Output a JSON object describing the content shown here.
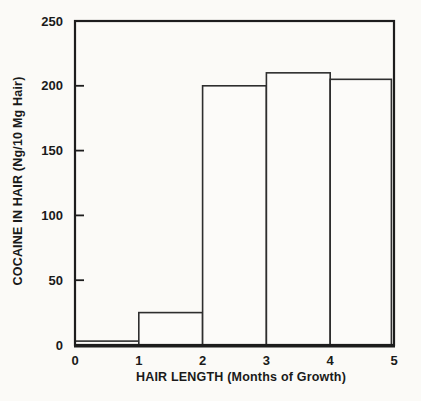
{
  "figure": {
    "background": "#fbfaf7",
    "line_color": "#1d1d1d",
    "bar_fill": "#fcfbf9"
  },
  "chart_data": {
    "type": "bar",
    "title": "",
    "xlabel": "HAIR LENGTH (Months of Growth)",
    "ylabel": "COCAINE IN HAIR (Ng/10 Mg Hair)",
    "categories": [
      "0-1",
      "1-2",
      "2-3",
      "3-4",
      "4-5"
    ],
    "x_bin_edges": [
      0,
      1,
      2,
      3,
      4,
      5
    ],
    "values": [
      3,
      25,
      200,
      210,
      205
    ],
    "xlim": [
      0,
      5
    ],
    "ylim": [
      0,
      250
    ],
    "x_ticks": [
      0,
      1,
      2,
      3,
      4,
      5
    ],
    "y_ticks": [
      0,
      50,
      100,
      150,
      200,
      250
    ],
    "grid": false,
    "legend": null,
    "bar_outline_only": true
  }
}
